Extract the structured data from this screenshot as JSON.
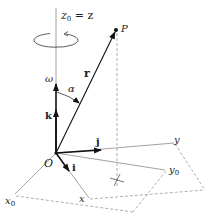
{
  "diagram": {
    "type": "rotating-frame-vector-diagram",
    "labels": {
      "z_axis": "z",
      "z_axis_sub": "0",
      "z_axis_eq": " = z",
      "omega": "ω",
      "k": "k",
      "alpha": "α",
      "r": "r",
      "P": "P",
      "j": "j",
      "i": "i",
      "O": "O",
      "y": "y",
      "y0": "y",
      "y0_sub": "0",
      "x0": "x",
      "x0_sub": "0",
      "x": "x"
    },
    "colors": {
      "vector": "#111111",
      "axis": "#8a8a8a",
      "dashed": "#9a9a9a",
      "text": "#222222"
    }
  }
}
